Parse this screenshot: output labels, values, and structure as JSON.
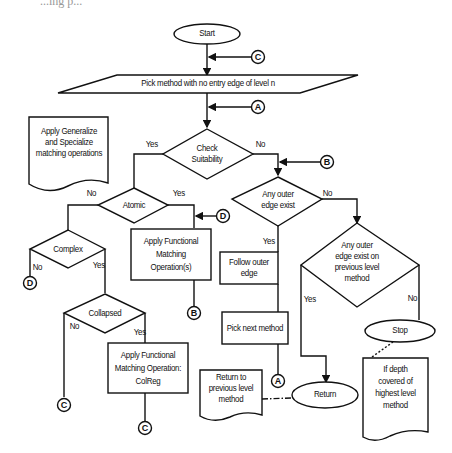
{
  "caption_fragment": "...ing p...",
  "nodes": {
    "start": "Start",
    "pick_method": "Pick method with no entry edge of level n",
    "check_suitability": [
      "Check",
      "Suitability"
    ],
    "generalize_note": [
      "Apply Generalize",
      "and Specialize",
      "matching operations"
    ],
    "atomic": "Atomic",
    "complex": "Complex",
    "apply_functional": [
      "Apply Functional",
      "Matching",
      "Operation(s)"
    ],
    "any_outer_edge": [
      "Any outer",
      "edge exist"
    ],
    "any_outer_prev": [
      "Any outer",
      "edge exist on",
      "previous level",
      "method"
    ],
    "follow_outer": [
      "Follow outer",
      "edge"
    ],
    "pick_next": "Pick next method",
    "collapsed": "Collapsed",
    "apply_colreg": [
      "Apply Functional",
      "Matching Operation:",
      "ColReg"
    ],
    "stop": "Stop",
    "return": "Return",
    "return_note": [
      "Return to",
      "previous level",
      "method"
    ],
    "depth_note": [
      "If depth",
      "covered of",
      "highest level",
      "method"
    ]
  },
  "edge_labels": {
    "check_yes": "Yes",
    "check_no": "No",
    "atomic_no": "No",
    "atomic_yes": "Yes",
    "any_outer_no": "No",
    "any_outer_yes": "Yes",
    "complex_no": "No",
    "complex_yes": "Yes",
    "collapsed_no": "No",
    "collapsed_yes": "Yes",
    "prev_yes": "Yes",
    "prev_no": "No"
  },
  "connectors": {
    "c_top": "C",
    "a_top": "A",
    "b_right": "B",
    "d_mid": "D",
    "d_left": "D",
    "b_bottom": "B",
    "c_left": "C",
    "c_bottom": "C",
    "a_bottom": "A"
  }
}
